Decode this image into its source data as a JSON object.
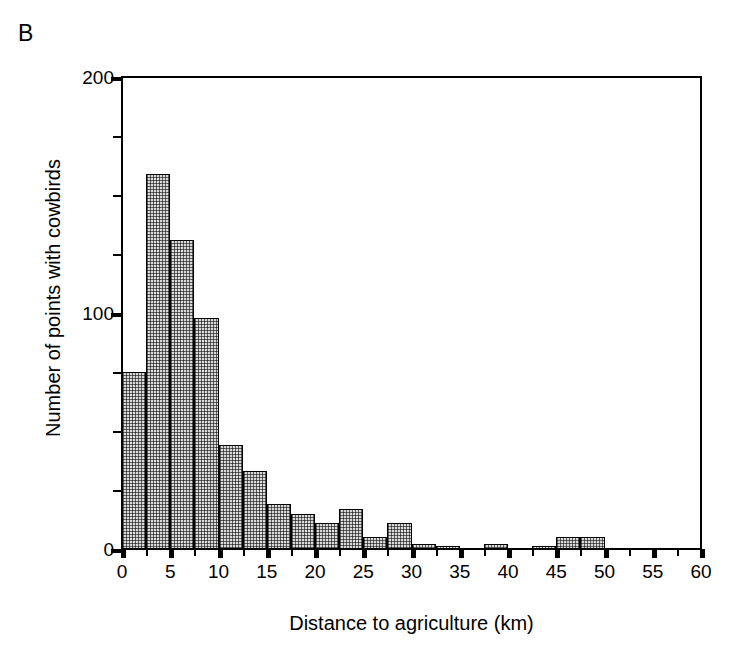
{
  "panel": {
    "label": "B"
  },
  "chart_data": {
    "type": "bar",
    "title": "",
    "subtitle": "",
    "xlabel": "Distance to agriculture (km)",
    "ylabel": "Number of points with cowbirds",
    "xlim": [
      0,
      60
    ],
    "ylim": [
      0,
      200
    ],
    "bin_width": 2.5,
    "grid": false,
    "legend": null,
    "x_tick_labels": [
      "0",
      "5",
      "10",
      "15",
      "20",
      "25",
      "30",
      "35",
      "40",
      "45",
      "50",
      "55",
      "60"
    ],
    "x_ticks": [
      0,
      5,
      10,
      15,
      20,
      25,
      30,
      35,
      40,
      45,
      50,
      55,
      60
    ],
    "x_minor_ticks": [
      2.5,
      7.5,
      12.5,
      17.5,
      22.5,
      27.5,
      32.5,
      37.5,
      42.5,
      47.5,
      52.5,
      57.5
    ],
    "y_tick_labels": [
      "0",
      "100",
      "200"
    ],
    "y_ticks": [
      0,
      100,
      200
    ],
    "y_minor_ticks": [
      25,
      50,
      75,
      125,
      150,
      175
    ],
    "bin_starts": [
      0,
      2.5,
      5,
      7.5,
      10,
      12.5,
      15,
      17.5,
      20,
      22.5,
      25,
      27.5,
      30,
      32.5,
      35,
      37.5,
      40,
      42.5,
      45,
      47.5,
      50,
      52.5,
      55,
      57.5
    ],
    "categories": [
      "0-2.5",
      "2.5-5",
      "5-7.5",
      "7.5-10",
      "10-12.5",
      "12.5-15",
      "15-17.5",
      "17.5-20",
      "20-22.5",
      "22.5-25",
      "25-27.5",
      "27.5-30",
      "30-32.5",
      "32.5-35",
      "35-37.5",
      "37.5-40",
      "40-42.5",
      "42.5-45",
      "45-47.5",
      "47.5-50",
      "50-52.5",
      "52.5-55",
      "55-57.5",
      "57.5-60"
    ],
    "values": [
      75,
      159,
      131,
      98,
      44,
      33,
      19,
      15,
      11,
      17,
      5,
      11,
      2,
      1,
      0,
      2,
      0,
      1,
      5,
      5,
      0,
      0,
      0,
      0
    ],
    "bar_fill": "#d8d8d8",
    "bar_edge": "#000000"
  }
}
